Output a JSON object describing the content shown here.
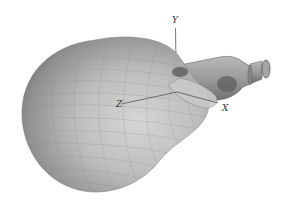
{
  "figure": {
    "axes": {
      "x_label": "X",
      "y_label": "Y",
      "z_label": "Z"
    },
    "colors": {
      "background": "#ffffff",
      "lobe_light": "#c8c8c8",
      "lobe_mid": "#a9a9a9",
      "lobe_dark": "#6f6f6f",
      "mesh": "#8a8a8a",
      "axis": "#555555",
      "feed": "#9a9a9a",
      "feed_dark": "#5f5f5f"
    }
  }
}
